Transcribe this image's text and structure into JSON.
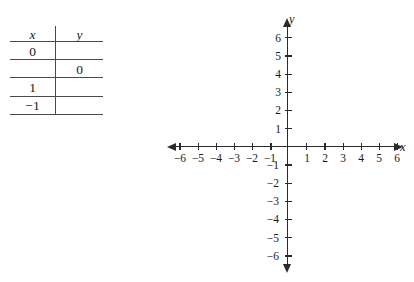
{
  "table": {
    "headers": {
      "x": "x",
      "y": "y"
    },
    "rows": [
      {
        "x": "0",
        "y": ""
      },
      {
        "x": "",
        "y": "0"
      },
      {
        "x": "1",
        "y": ""
      },
      {
        "x": "−1",
        "y": ""
      }
    ]
  },
  "graph": {
    "x_axis_label": "x",
    "y_axis_label": "y",
    "x_ticks": [
      "−6",
      "−5",
      "−4",
      "−3",
      "−2",
      "−1",
      "1",
      "2",
      "3",
      "4",
      "5",
      "6"
    ],
    "y_ticks": [
      "6",
      "5",
      "4",
      "3",
      "2",
      "1",
      "−1",
      "−2",
      "−3",
      "−4",
      "−5",
      "−6"
    ],
    "x_range": [
      -6,
      6
    ],
    "y_range": [
      -6,
      6
    ],
    "grid": false,
    "plotted_points": []
  }
}
